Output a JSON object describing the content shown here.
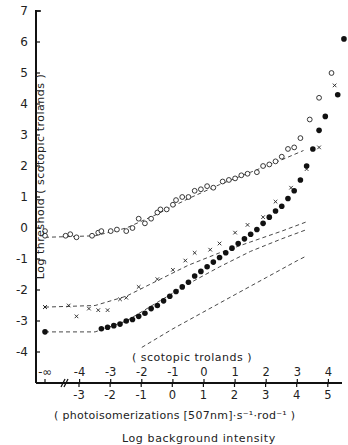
{
  "chart_data": {
    "type": "scatter",
    "title": "",
    "ylabel": "Log threshold ( scotopic trolands )",
    "xlabel": "Log background intensity",
    "x_scale_upper_label": "( scotopic trolands )",
    "x_scale_lower_label": "( photoisomerizations [507nm]·s⁻¹·rod⁻¹ )",
    "ylim": [
      -4.8,
      7
    ],
    "xlim": [
      -4.3,
      5
    ],
    "y_ticks": [
      "7",
      "6",
      "5",
      "4",
      "3",
      "2",
      "1",
      "0",
      "-1",
      "-2",
      "-3",
      "-4"
    ],
    "x_ticks_scotopic": [
      "-∞",
      "-4",
      "-3",
      "-2",
      "-1",
      "0",
      "1",
      "2",
      "3",
      "4"
    ],
    "x_ticks_photoisomerizations": [
      "-3",
      "-2",
      "-1",
      "0",
      "1",
      "2",
      "3",
      "4",
      "5"
    ],
    "grid": false,
    "legend": "none",
    "series": [
      {
        "name": "open circles",
        "marker": "open-circle",
        "points": [
          [
            -4.6,
            -0.25
          ],
          [
            -4.55,
            -0.1
          ],
          [
            -4.45,
            -0.25
          ],
          [
            -4.3,
            -0.2
          ],
          [
            -4.1,
            -0.3
          ],
          [
            -3.6,
            -0.25
          ],
          [
            -3.4,
            -0.15
          ],
          [
            -3.3,
            -0.1
          ],
          [
            -3.0,
            -0.1
          ],
          [
            -2.8,
            -0.05
          ],
          [
            -2.5,
            -0.1
          ],
          [
            -2.3,
            0.0
          ],
          [
            -2.1,
            0.3
          ],
          [
            -1.9,
            0.15
          ],
          [
            -1.7,
            0.3
          ],
          [
            -1.5,
            0.5
          ],
          [
            -1.4,
            0.6
          ],
          [
            -1.2,
            0.6
          ],
          [
            -1.0,
            0.75
          ],
          [
            -0.9,
            0.9
          ],
          [
            -0.7,
            1.0
          ],
          [
            -0.5,
            1.0
          ],
          [
            -0.3,
            1.2
          ],
          [
            -0.1,
            1.25
          ],
          [
            0.1,
            1.35
          ],
          [
            0.3,
            1.3
          ],
          [
            0.6,
            1.5
          ],
          [
            0.8,
            1.55
          ],
          [
            1.0,
            1.6
          ],
          [
            1.2,
            1.7
          ],
          [
            1.4,
            1.75
          ],
          [
            1.7,
            1.8
          ],
          [
            1.9,
            2.0
          ],
          [
            2.1,
            2.05
          ],
          [
            2.3,
            2.15
          ],
          [
            2.5,
            2.3
          ],
          [
            2.7,
            2.55
          ],
          [
            2.9,
            2.6
          ],
          [
            3.1,
            2.9
          ],
          [
            3.4,
            3.5
          ],
          [
            3.7,
            4.2
          ],
          [
            4.1,
            5.0
          ]
        ],
        "fit": [
          [
            -4.6,
            -0.3
          ],
          [
            -3.5,
            -0.25
          ],
          [
            -2.5,
            0.0
          ],
          [
            -1.5,
            0.45
          ],
          [
            -0.5,
            0.95
          ],
          [
            0.5,
            1.4
          ],
          [
            1.5,
            1.8
          ],
          [
            2.5,
            2.2
          ],
          [
            3.2,
            2.5
          ]
        ]
      },
      {
        "name": "crosses",
        "marker": "x",
        "points": [
          [
            -4.6,
            -2.55
          ],
          [
            -4.5,
            -2.55
          ],
          [
            -4.35,
            -2.5
          ],
          [
            -4.1,
            -2.85
          ],
          [
            -3.7,
            -2.6
          ],
          [
            -3.4,
            -2.65
          ],
          [
            -3.1,
            -2.65
          ],
          [
            -2.7,
            -2.3
          ],
          [
            -2.5,
            -2.25
          ],
          [
            -2.1,
            -1.9
          ],
          [
            -1.5,
            -1.65
          ],
          [
            -1.0,
            -1.35
          ],
          [
            -0.6,
            -1.05
          ],
          [
            -0.3,
            -0.8
          ],
          [
            0.2,
            -0.7
          ],
          [
            0.5,
            -0.5
          ],
          [
            1.0,
            -0.15
          ],
          [
            1.4,
            0.1
          ],
          [
            1.9,
            0.35
          ],
          [
            2.3,
            0.85
          ],
          [
            2.8,
            1.3
          ],
          [
            3.3,
            1.9
          ],
          [
            3.7,
            2.6
          ],
          [
            4.2,
            4.6
          ]
        ],
        "fit": [
          [
            -4.6,
            -2.55
          ],
          [
            -3.5,
            -2.5
          ],
          [
            -2.5,
            -2.2
          ],
          [
            -1.5,
            -1.7
          ],
          [
            -0.5,
            -1.2
          ],
          [
            0.5,
            -0.8
          ],
          [
            1.5,
            -0.45
          ],
          [
            2.5,
            -0.1
          ],
          [
            3.3,
            0.2
          ]
        ]
      },
      {
        "name": "filled circles",
        "marker": "filled-circle",
        "points": [
          [
            -4.5,
            -3.35
          ],
          [
            -3.3,
            -3.25
          ],
          [
            -3.1,
            -3.2
          ],
          [
            -2.9,
            -3.15
          ],
          [
            -2.7,
            -3.1
          ],
          [
            -2.5,
            -3.0
          ],
          [
            -2.3,
            -2.95
          ],
          [
            -2.1,
            -2.85
          ],
          [
            -1.9,
            -2.75
          ],
          [
            -1.7,
            -2.6
          ],
          [
            -1.5,
            -2.5
          ],
          [
            -1.3,
            -2.35
          ],
          [
            -1.1,
            -2.2
          ],
          [
            -0.9,
            -2.05
          ],
          [
            -0.7,
            -1.9
          ],
          [
            -0.5,
            -1.75
          ],
          [
            -0.3,
            -1.55
          ],
          [
            -0.1,
            -1.4
          ],
          [
            0.1,
            -1.25
          ],
          [
            0.3,
            -1.1
          ],
          [
            0.5,
            -0.95
          ],
          [
            0.7,
            -0.8
          ],
          [
            0.9,
            -0.65
          ],
          [
            1.1,
            -0.5
          ],
          [
            1.3,
            -0.35
          ],
          [
            1.5,
            -0.2
          ],
          [
            1.7,
            -0.05
          ],
          [
            1.9,
            0.15
          ],
          [
            2.1,
            0.35
          ],
          [
            2.3,
            0.55
          ],
          [
            2.5,
            0.7
          ],
          [
            2.7,
            0.95
          ],
          [
            2.9,
            1.2
          ],
          [
            3.1,
            1.55
          ],
          [
            3.3,
            2.0
          ],
          [
            3.5,
            2.55
          ],
          [
            3.7,
            3.15
          ],
          [
            3.9,
            3.6
          ],
          [
            4.3,
            4.3
          ],
          [
            4.5,
            6.1
          ]
        ],
        "fit_lower": [
          [
            -4.6,
            -3.35
          ],
          [
            -3.5,
            -3.35
          ],
          [
            -2.5,
            -3.0
          ],
          [
            -1.5,
            -2.4
          ],
          [
            -0.5,
            -1.8
          ],
          [
            0.5,
            -1.25
          ],
          [
            1.5,
            -0.75
          ],
          [
            2.5,
            -0.35
          ],
          [
            3.3,
            -0.05
          ]
        ],
        "fit_lowest": [
          [
            -2.0,
            -3.85
          ],
          [
            -1.0,
            -3.25
          ],
          [
            0.0,
            -2.7
          ],
          [
            1.0,
            -2.15
          ],
          [
            2.0,
            -1.6
          ],
          [
            3.0,
            -1.05
          ],
          [
            3.3,
            -0.9
          ]
        ]
      }
    ]
  }
}
